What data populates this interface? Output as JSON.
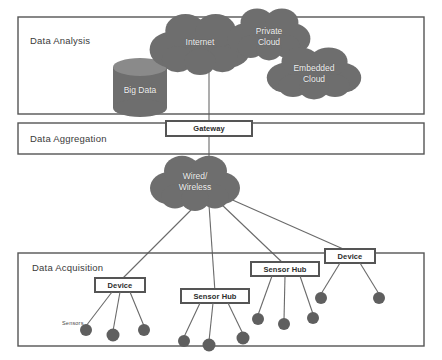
{
  "diagram": {
    "colors": {
      "cloud_fill": "#6e6e6e",
      "cylinder_fill": "#6e6e6e",
      "cylinder_top": "#8a8a8a",
      "node_border": "#555555",
      "node_fill": "#ffffff",
      "sensor_fill": "#5f5f5f",
      "frame_stroke": "#555555",
      "line_stroke": "#6a6a6a",
      "background": "#ffffff",
      "cloud_text": "#f2f2f2",
      "band_text": "#3a3a3a"
    },
    "layers": [
      {
        "id": "analysis",
        "label": "Data Analysis"
      },
      {
        "id": "aggregation",
        "label": "Data Aggregation"
      },
      {
        "id": "acquisition",
        "label": "Data Acquisition"
      }
    ],
    "clouds": [
      {
        "id": "internet",
        "label": "Internet"
      },
      {
        "id": "private_cloud",
        "label_line1": "Private",
        "label_line2": "Cloud"
      },
      {
        "id": "embedded_cloud",
        "label_line1": "Embedded",
        "label_line2": "Cloud"
      },
      {
        "id": "wired_wireless",
        "label_line1": "Wired/",
        "label_line2": "Wireless"
      }
    ],
    "storage": {
      "id": "big_data",
      "label": "Big Data"
    },
    "gateway": {
      "label": "Gateway"
    },
    "edge_nodes": [
      {
        "id": "device-1",
        "label": "Device",
        "sensor_count": 3
      },
      {
        "id": "sensor-hub-1",
        "label": "Sensor Hub",
        "sensor_count": 3
      },
      {
        "id": "sensor-hub-2",
        "label": "Sensor Hub",
        "sensor_count": 3
      },
      {
        "id": "device-2",
        "label": "Device",
        "sensor_count": 2
      }
    ],
    "sensors_caption": "Sensors"
  }
}
